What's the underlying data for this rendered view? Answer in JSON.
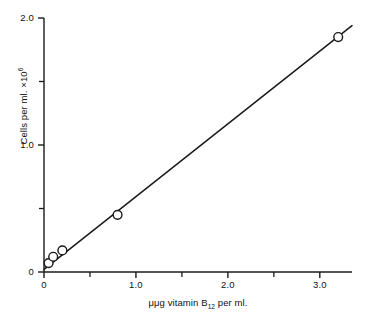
{
  "figure": {
    "background_color": "#ffffff",
    "ink_color": "#1a1a1a"
  },
  "chart_data": {
    "type": "scatter",
    "title": "",
    "subtitle": "",
    "xlabel_parts": {
      "prefix": "μμg vitamin B",
      "subscript": "12",
      "suffix": " per ml."
    },
    "ylabel_parts": {
      "prefix": "Cells per ml. ×10",
      "superscript": "6",
      "suffix": ""
    },
    "xlabel": "μμg vitamin B12 per ml.",
    "ylabel": "Cells per ml. ×10⁶",
    "xlim": [
      0,
      3.35
    ],
    "ylim": [
      0,
      2.0
    ],
    "grid": false,
    "legend": "none",
    "marker_style": "open-circle",
    "line_style": "solid-straight",
    "x_major_ticks": [
      0,
      1.0,
      2.0,
      3.0
    ],
    "x_major_tick_labels": [
      "0",
      "1.0",
      "2.0",
      "3.0"
    ],
    "x_minor_ticks": [
      0.5,
      1.5,
      2.5
    ],
    "y_major_ticks": [
      0,
      1.0,
      2.0
    ],
    "y_major_tick_labels": [
      "0",
      "1.0",
      "2.0"
    ],
    "y_minor_ticks": [
      0.5,
      1.5
    ],
    "x": [
      0.05,
      0.1,
      0.2,
      0.8,
      3.2
    ],
    "values": [
      0.07,
      0.12,
      0.17,
      0.45,
      1.85
    ],
    "points": [
      {
        "x": 0.05,
        "y": 0.07
      },
      {
        "x": 0.1,
        "y": 0.12
      },
      {
        "x": 0.2,
        "y": 0.17
      },
      {
        "x": 0.8,
        "y": 0.45
      },
      {
        "x": 3.2,
        "y": 1.85
      }
    ],
    "line_endpoints": [
      {
        "x": 0.0,
        "y": 0.02
      },
      {
        "x": 3.35,
        "y": 1.94
      }
    ],
    "annotations": []
  }
}
